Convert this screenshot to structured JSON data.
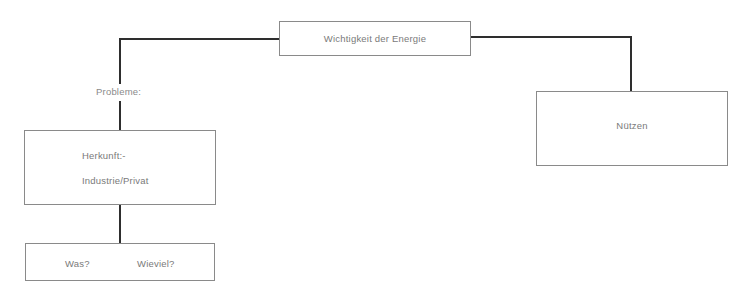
{
  "diagram": {
    "root": {
      "label": "Wichtigkeit der Energie"
    },
    "left_branch": {
      "connector_label": "Probleme:",
      "origin_box": {
        "line1": "Herkunft:-",
        "line2": "Industrie/Privat"
      },
      "detail_box": {
        "item1": "Was?",
        "item2": "Wieviel?"
      }
    },
    "right_branch": {
      "box": {
        "label": "Nützen"
      }
    }
  },
  "colors": {
    "connector": "#2e2e2e",
    "box_border": "#8a8a8a",
    "text": "#7a7a7a",
    "background": "#ffffff"
  }
}
